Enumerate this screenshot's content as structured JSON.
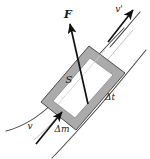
{
  "figure": {
    "name": "stream-tube-control-volume",
    "background_color": "#ffffff",
    "line_color": "#3a3a3a",
    "arrow_color": "#111111",
    "band_fill": "#a8a8a8",
    "band_inner_fill": "#ffffff",
    "labels": {
      "force": "F",
      "velocity_in": "v",
      "velocity_out": "v'",
      "area": "S",
      "time_interval": "Δt",
      "mass_element": "Δm"
    }
  }
}
